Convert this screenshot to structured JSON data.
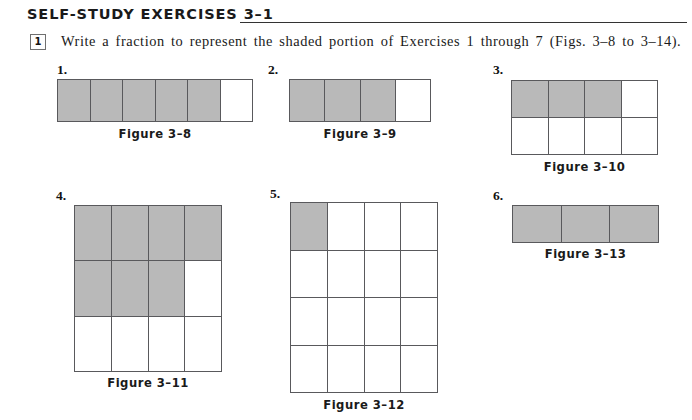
{
  "header": {
    "title": "SELF-STUDY EXERCISES 3–1"
  },
  "instruction": {
    "number": "1",
    "text": "Write a fraction to represent the shaded portion of Exercises 1 through 7 (Figs. 3–8 to 3–14)."
  },
  "colors": {
    "shaded_fill": "#b9b9b9",
    "cell_border": "#59595c",
    "text": "#1a1a1a",
    "page_background": "#ffffff"
  },
  "exercises": [
    {
      "number": "1.",
      "caption": "Figure 3–8",
      "columns": 6,
      "rows": 1,
      "shaded_count": 5,
      "total_cells": 6,
      "fraction": "5/6",
      "cells": [
        true,
        true,
        true,
        true,
        true,
        false
      ]
    },
    {
      "number": "2.",
      "caption": "Figure 3–9",
      "columns": 4,
      "rows": 1,
      "shaded_count": 3,
      "total_cells": 4,
      "fraction": "3/4",
      "cells": [
        true,
        true,
        true,
        false
      ]
    },
    {
      "number": "3.",
      "caption": "Figure 3–10",
      "columns": 4,
      "rows": 2,
      "shaded_count": 3,
      "total_cells": 8,
      "fraction": "3/8",
      "cells": [
        true,
        true,
        true,
        false,
        false,
        false,
        false,
        false
      ]
    },
    {
      "number": "4.",
      "caption": "Figure 3–11",
      "columns": 4,
      "rows": 3,
      "shaded_count": 7,
      "total_cells": 12,
      "fraction": "7/12",
      "cells": [
        true,
        true,
        true,
        true,
        true,
        true,
        true,
        false,
        false,
        false,
        false,
        false
      ]
    },
    {
      "number": "5.",
      "caption": "Figure 3–12",
      "columns": 4,
      "rows": 4,
      "shaded_count": 1,
      "total_cells": 16,
      "fraction": "1/16",
      "cells": [
        true,
        false,
        false,
        false,
        false,
        false,
        false,
        false,
        false,
        false,
        false,
        false,
        false,
        false,
        false,
        false
      ]
    },
    {
      "number": "6.",
      "caption": "Figure 3–13",
      "columns": 3,
      "rows": 1,
      "shaded_count": 3,
      "total_cells": 3,
      "fraction": "3/3",
      "cells": [
        true,
        true,
        true
      ]
    }
  ],
  "layout": {
    "figures": [
      {
        "grid_left": 57,
        "grid_top": 79,
        "grid_width": 196,
        "grid_height": 43,
        "num_left": 57,
        "num_top": 62,
        "cap_left": 57,
        "cap_top": 127,
        "cap_width": 196
      },
      {
        "grid_left": 289,
        "grid_top": 79,
        "grid_width": 142,
        "grid_height": 43,
        "num_left": 268,
        "num_top": 62,
        "cap_left": 289,
        "cap_top": 127,
        "cap_width": 142
      },
      {
        "grid_left": 511,
        "grid_top": 80,
        "grid_width": 147,
        "grid_height": 75,
        "num_left": 493,
        "num_top": 62,
        "cap_left": 511,
        "cap_top": 160,
        "cap_width": 147
      },
      {
        "grid_left": 74,
        "grid_top": 205,
        "grid_width": 148,
        "grid_height": 167,
        "num_left": 56,
        "num_top": 188,
        "cap_left": 74,
        "cap_top": 376,
        "cap_width": 148
      },
      {
        "grid_left": 290,
        "grid_top": 202,
        "grid_width": 148,
        "grid_height": 191,
        "num_left": 270,
        "num_top": 186,
        "cap_left": 290,
        "cap_top": 398,
        "cap_width": 148
      },
      {
        "grid_left": 512,
        "grid_top": 205,
        "grid_width": 147,
        "grid_height": 38,
        "num_left": 493,
        "num_top": 188,
        "cap_left": 512,
        "cap_top": 247,
        "cap_width": 147
      }
    ]
  }
}
